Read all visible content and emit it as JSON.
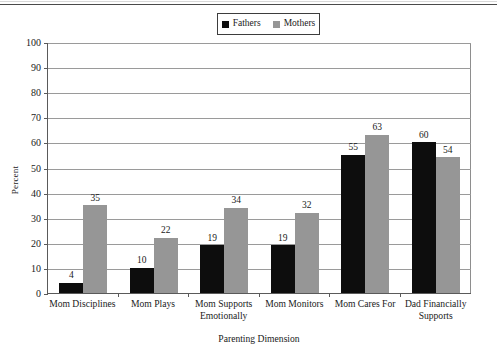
{
  "figure": {
    "has_top_rule": true
  },
  "legend": {
    "position": "top-center",
    "entries": [
      {
        "label": "Fathers",
        "color": "#0d0d0d",
        "icon": "square-swatch-icon"
      },
      {
        "label": "Mothers",
        "color": "#969696",
        "icon": "square-swatch-icon"
      }
    ]
  },
  "axes": {
    "ylabel": "Percent",
    "xlabel": "Parenting Dimension",
    "yticks": [
      0,
      10,
      20,
      30,
      40,
      50,
      60,
      70,
      80,
      90,
      100
    ],
    "ymin": 0,
    "ymax": 100
  },
  "chart_data": {
    "type": "bar",
    "title": "",
    "subtitle": "",
    "xlabel": "Parenting Dimension",
    "ylabel": "Percent",
    "ylim": [
      0,
      100
    ],
    "grid": true,
    "legend_position": "top-center",
    "categories": [
      "Mom Disciplines",
      "Mom Plays",
      "Mom Supports Emotionally",
      "Mom Monitors",
      "Mom Cares For",
      "Dad Financially Supports"
    ],
    "category_lines": [
      [
        "Mom Disciplines"
      ],
      [
        "Mom Plays"
      ],
      [
        "Mom Supports",
        "Emotionally"
      ],
      [
        "Mom Monitors"
      ],
      [
        "Mom Cares For"
      ],
      [
        "Dad Financially",
        "Supports"
      ]
    ],
    "series": [
      {
        "name": "Fathers",
        "color": "#0d0d0d",
        "values": [
          4,
          10,
          19,
          19,
          55,
          60
        ]
      },
      {
        "name": "Mothers",
        "color": "#969696",
        "values": [
          35,
          22,
          34,
          32,
          63,
          54
        ]
      }
    ],
    "ticklabels": [
      "0",
      "10",
      "20",
      "30",
      "40",
      "50",
      "60",
      "70",
      "80",
      "90",
      "100"
    ]
  }
}
